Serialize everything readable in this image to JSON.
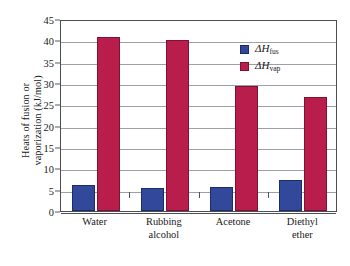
{
  "chart_data": {
    "type": "bar",
    "title": "",
    "xlabel": "",
    "ylabel_line1": "Heats of fusion or",
    "ylabel_line2": "vaporization (kJ/mol)",
    "categories": [
      "Water",
      "Rubbing alcohol",
      "Acetone",
      "Diethyl ether"
    ],
    "category_lines": [
      [
        "Water"
      ],
      [
        "Rubbing",
        "alcohol"
      ],
      [
        "Acetone"
      ],
      [
        "Diethyl",
        "ether"
      ]
    ],
    "series": [
      {
        "name": "delta-H-fus",
        "legend_symbol": "ΔH",
        "legend_sub": "fus",
        "color": "#32499b",
        "values": [
          6.0,
          5.4,
          5.7,
          7.3
        ]
      },
      {
        "name": "delta-H-vap",
        "legend_symbol": "ΔH",
        "legend_sub": "vap",
        "color": "#b81d4c",
        "values": [
          40.7,
          40.0,
          29.2,
          26.7
        ]
      }
    ],
    "ylim": [
      0,
      45
    ],
    "ytick_values": [
      0,
      5,
      10,
      15,
      20,
      25,
      30,
      35,
      40,
      45
    ],
    "ytick_labels": [
      "0",
      "5",
      "10",
      "15",
      "20",
      "25",
      "30",
      "35",
      "40",
      "45"
    ],
    "grid": true,
    "legend_position": "top-right",
    "frame_color": "#4c4f54",
    "gridline_color": "#9aa1ab",
    "background": "#ffffff"
  }
}
